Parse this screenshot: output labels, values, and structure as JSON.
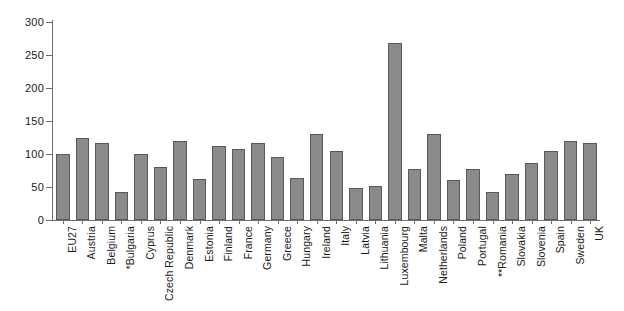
{
  "chart_data": {
    "type": "bar",
    "title": "",
    "subtitle": "",
    "xlabel": "",
    "ylabel": "",
    "ylim": [
      0,
      300
    ],
    "yticks": [
      0,
      50,
      100,
      150,
      200,
      250,
      300
    ],
    "ytick_labels": [
      "0",
      "50",
      "100",
      "150",
      "200",
      "250",
      "300"
    ],
    "grid": false,
    "legend": null,
    "bar_color": "#8a8a8a",
    "bar_edge_color": "#595959",
    "axis_color": "#6e6e6e",
    "background_color": "#ffffff",
    "categories": [
      "EU27",
      "Austria",
      "Belgium",
      "*Bulgaria",
      "Cyprus",
      "Czech Republic",
      "Denmark",
      "Estonia",
      "Finland",
      "France",
      "Germany",
      "Greece",
      "Hungary",
      "Ireland",
      "Italy",
      "Latvia",
      "Lithuania",
      "Luxembourg",
      "Malta",
      "Netherlands",
      "Poland",
      "Portugal",
      "**Romania",
      "Slovakia",
      "Slovenia",
      "Spain",
      "Sweden",
      "UK"
    ],
    "values": [
      100,
      124,
      117,
      43,
      100,
      81,
      119,
      62,
      112,
      107,
      117,
      96,
      64,
      131,
      104,
      48,
      52,
      268,
      78,
      131,
      61,
      78,
      42,
      70,
      86,
      104,
      119,
      116
    ],
    "footnotes": [
      "*Bulgaria",
      "**Romania"
    ]
  }
}
